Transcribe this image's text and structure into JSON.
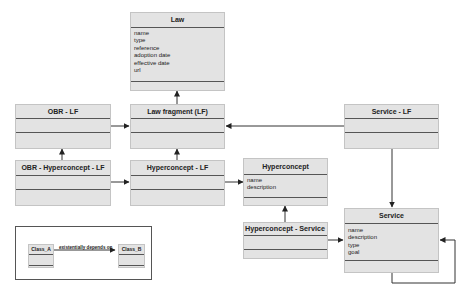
{
  "diagram": {
    "type": "uml-class-diagram",
    "classes": {
      "law": {
        "name": "Law",
        "attributes": [
          "name",
          "type",
          "reference",
          "adoption date",
          "effective date",
          "url"
        ]
      },
      "law_fragment": {
        "name": "Law fragment (LF)",
        "attributes": []
      },
      "obr_lf": {
        "name": "OBR - LF",
        "attributes": []
      },
      "service_lf": {
        "name": "Service - LF",
        "attributes": []
      },
      "obr_hyperconcept_lf": {
        "name": "OBR - Hyperconcept - LF",
        "attributes": []
      },
      "hyperconcept_lf": {
        "name": "Hyperconcept - LF",
        "attributes": []
      },
      "hyperconcept": {
        "name": "Hyperconcept",
        "attributes": [
          "name",
          "description"
        ]
      },
      "hyperconcept_service": {
        "name": "Hyperconcept - Service",
        "attributes": []
      },
      "service": {
        "name": "Service",
        "attributes": [
          "name",
          "description",
          "type",
          "goal"
        ]
      }
    },
    "relations": [
      {
        "from": "Law fragment (LF)",
        "to": "Law"
      },
      {
        "from": "OBR - LF",
        "to": "Law fragment (LF)"
      },
      {
        "from": "Service - LF",
        "to": "Law fragment (LF)"
      },
      {
        "from": "Service - LF",
        "to": "Service"
      },
      {
        "from": "OBR - Hyperconcept - LF",
        "to": "OBR - LF"
      },
      {
        "from": "OBR - Hyperconcept - LF",
        "to": "Hyperconcept - LF"
      },
      {
        "from": "Hyperconcept - LF",
        "to": "Law fragment (LF)"
      },
      {
        "from": "Hyperconcept - LF",
        "to": "Hyperconcept"
      },
      {
        "from": "Hyperconcept - Service",
        "to": "Hyperconcept"
      },
      {
        "from": "Hyperconcept - Service",
        "to": "Service"
      },
      {
        "from": "Service",
        "to": "Service"
      }
    ],
    "legend": {
      "class_a": "Class_A",
      "class_b": "Class_B",
      "relation_label": "existentially depends on"
    },
    "colors": {
      "box_fill": "#e3e3e3",
      "line": "#333333",
      "background": "#ffffff"
    }
  }
}
